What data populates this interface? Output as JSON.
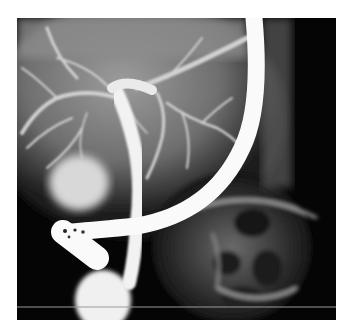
{
  "image": {
    "kind": "fluoroscopic cholangiogram (ERCP)",
    "background_color": "#ffffff",
    "frame": {
      "left": 17,
      "top": 18,
      "width": 319,
      "height": 302
    },
    "colors": {
      "field_dark": "#050505",
      "liver_gray": "#8a8a8a",
      "contrast_white": "#f4f4f4",
      "scale_line": "#9a9a9a"
    },
    "elements": [
      "endoscope",
      "common-bile-duct",
      "intrahepatic-ducts",
      "gallbladder-region",
      "duodenum-bulb",
      "bowel-gas-pattern",
      "scale-line"
    ]
  }
}
